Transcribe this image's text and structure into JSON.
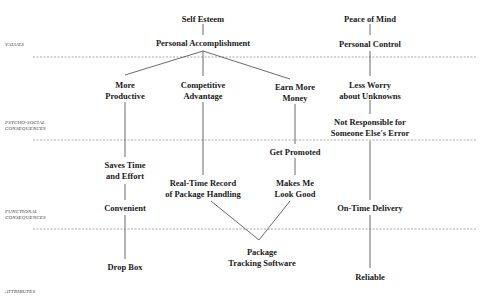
{
  "levels": [
    {
      "id": "values",
      "label": "VALUES",
      "y": 57,
      "label_y": 42
    },
    {
      "id": "psycho",
      "label": "PSYCHO-SOCIAL CONSEQUENCES",
      "y": 140,
      "label_y": 120
    },
    {
      "id": "functional",
      "label": "FUNCTIONAL CONSEQUENCES",
      "y": 229,
      "label_y": 209
    },
    {
      "id": "attributes",
      "label": "ATTRIBUTES",
      "y": null,
      "label_y": 289
    }
  ],
  "separator_range": [
    33,
    477
  ],
  "nodes": {
    "self_esteem": {
      "text": "Self Esteem",
      "x": 203,
      "y": 14
    },
    "personal_accomplishment": {
      "text": "Personal Accomplishment",
      "x": 203,
      "y": 38
    },
    "peace_of_mind": {
      "text": "Peace of Mind",
      "x": 370,
      "y": 14
    },
    "personal_control": {
      "text": "Personal Control",
      "x": 370,
      "y": 39
    },
    "more_productive": {
      "text": "More\nProductive",
      "x": 125,
      "y": 80
    },
    "competitive_advantage": {
      "text": "Competitive\nAdvantage",
      "x": 203,
      "y": 80
    },
    "earn_more_money": {
      "text": "Earn More\nMoney",
      "x": 295,
      "y": 82
    },
    "less_worry": {
      "text": "Less Worry\nabout Unknowns",
      "x": 370,
      "y": 80
    },
    "not_responsible": {
      "text": "Not Responsible for\nSomeone Else's Error",
      "x": 370,
      "y": 117
    },
    "saves_time": {
      "text": "Saves Time\nand Effort",
      "x": 125,
      "y": 160
    },
    "get_promoted": {
      "text": "Get Promoted",
      "x": 295,
      "y": 147
    },
    "real_time_record": {
      "text": "Real-Time Record\nof Package Handling",
      "x": 203,
      "y": 178
    },
    "makes_me_look_good": {
      "text": "Makes Me\nLook Good",
      "x": 295,
      "y": 178
    },
    "convenient": {
      "text": "Convenient",
      "x": 125,
      "y": 203
    },
    "on_time_delivery": {
      "text": "On-Time Delivery",
      "x": 370,
      "y": 203
    },
    "drop_box": {
      "text": "Drop Box",
      "x": 125,
      "y": 262
    },
    "package_tracking": {
      "text": "Package\nTracking Software",
      "x": 262,
      "y": 247
    },
    "reliable": {
      "text": "Reliable",
      "x": 370,
      "y": 272
    }
  },
  "edges": [
    [
      203,
      24,
      203,
      35
    ],
    [
      370,
      24,
      370,
      35
    ],
    [
      203,
      51,
      125,
      75
    ],
    [
      203,
      51,
      203,
      76
    ],
    [
      203,
      51,
      290,
      79
    ],
    [
      370,
      51,
      370,
      76
    ],
    [
      125,
      102,
      125,
      157
    ],
    [
      370,
      100,
      370,
      114
    ],
    [
      295,
      104,
      295,
      144
    ],
    [
      203,
      102,
      203,
      175
    ],
    [
      295,
      158,
      295,
      175
    ],
    [
      125,
      184,
      125,
      200
    ],
    [
      370,
      141,
      370,
      200
    ],
    [
      125,
      215,
      125,
      259
    ],
    [
      370,
      215,
      370,
      268
    ],
    [
      211,
      201,
      259,
      240
    ],
    [
      259,
      240,
      290,
      201
    ]
  ]
}
